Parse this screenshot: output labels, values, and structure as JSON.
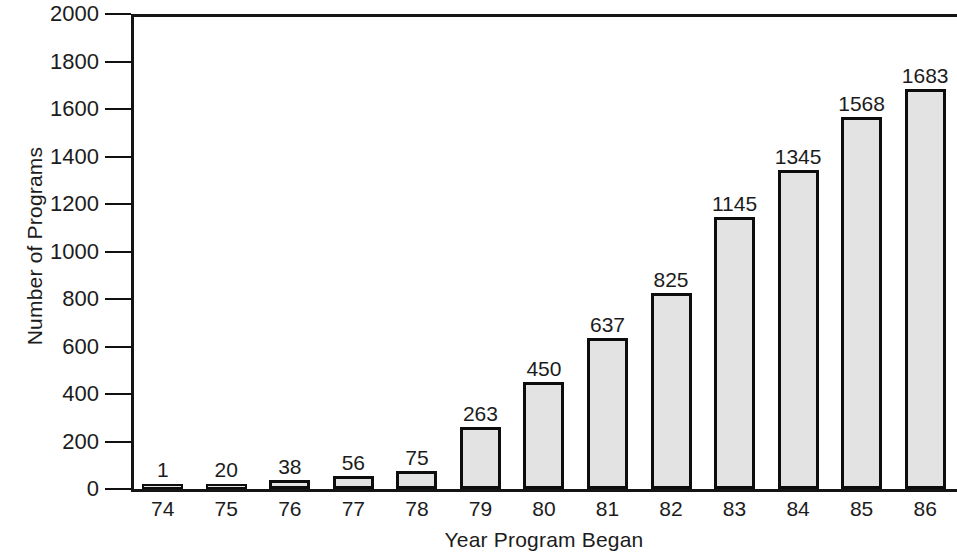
{
  "chart_data": {
    "type": "bar",
    "title": "",
    "xlabel": "Year Program Began",
    "ylabel": "Number of Programs",
    "categories": [
      "74",
      "75",
      "76",
      "77",
      "78",
      "79",
      "80",
      "81",
      "82",
      "83",
      "84",
      "85",
      "86"
    ],
    "values": [
      1,
      20,
      38,
      56,
      75,
      263,
      450,
      637,
      825,
      1145,
      1345,
      1568,
      1683
    ],
    "data_labels": [
      "1",
      "20",
      "38",
      "56",
      "75",
      "263",
      "450",
      "637",
      "825",
      "1145",
      "1345",
      "1568",
      "1683"
    ],
    "ylim": [
      0,
      2000
    ],
    "ytick_values": [
      0,
      200,
      400,
      600,
      800,
      1000,
      1200,
      1400,
      1600,
      1800,
      2000
    ],
    "ytick_labels": [
      "0",
      "200",
      "400",
      "600",
      "800",
      "1000",
      "1200",
      "1400",
      "1600",
      "1800",
      "2000"
    ],
    "grid": false,
    "legend": null,
    "bar_fill_color": "#e3e3e3",
    "bar_edge_color": "#0d0d0d",
    "axis_color": "#141414",
    "background_color": "#ffffff"
  }
}
